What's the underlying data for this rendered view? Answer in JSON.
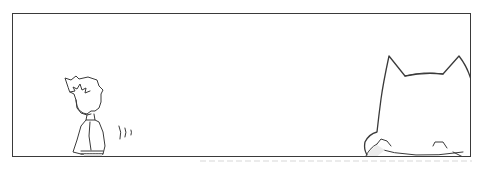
{
  "page": {
    "type": "comic-panel",
    "background_color": "#ffffff",
    "line_color": "#3a3a3a"
  },
  "panel": {
    "characters": [
      {
        "name": "boy",
        "position": "left",
        "details": "spiky hair, light shirt, belt, facing left"
      },
      {
        "name": "cat",
        "position": "bottom-right",
        "details": "huge rounded head with two pointed ears, cut off by panel edge, small paws visible at bottom"
      }
    ],
    "effects": [
      {
        "name": "motion-lines",
        "position": "right of boy"
      }
    ],
    "text": []
  }
}
